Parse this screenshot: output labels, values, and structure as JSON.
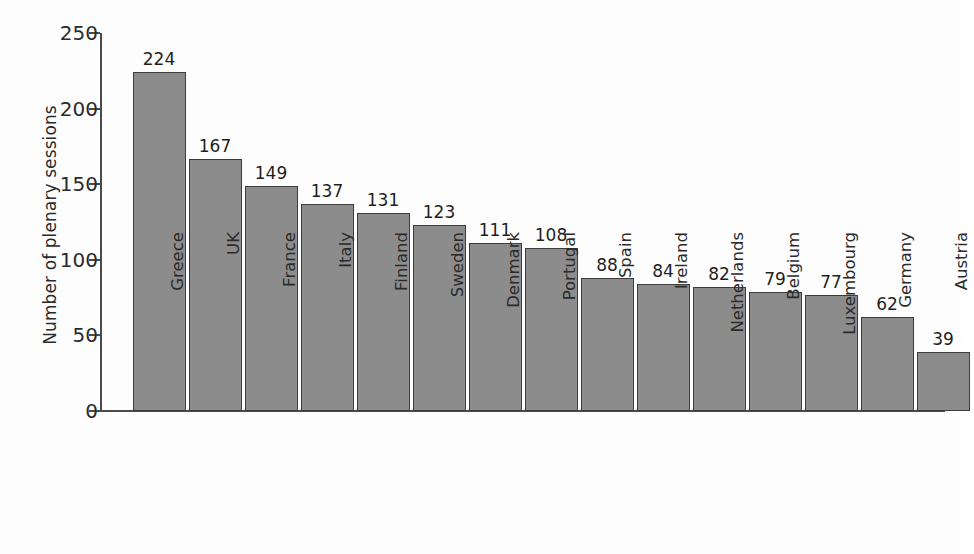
{
  "chart_data": {
    "type": "bar",
    "title": "",
    "xlabel": "",
    "ylabel": "Number of plenary sessions",
    "ylim": [
      0,
      250
    ],
    "yticks": [
      0,
      50,
      100,
      150,
      200,
      250
    ],
    "grid": false,
    "legend": false,
    "orientation": "vertical",
    "bar_color": "#8c8c8c",
    "bar_edge_color": "#3d3d3d",
    "data_labels": true,
    "categories": [
      "Greece",
      "UK",
      "France",
      "Italy",
      "Finland",
      "Sweden",
      "Denmark",
      "Portugal",
      "Spain",
      "Ireland",
      "Netherlands",
      "Belgium",
      "Luxembourg",
      "Germany",
      "Austria"
    ],
    "values": [
      224,
      167,
      149,
      137,
      131,
      123,
      111,
      108,
      88,
      84,
      82,
      79,
      77,
      62,
      39
    ]
  }
}
